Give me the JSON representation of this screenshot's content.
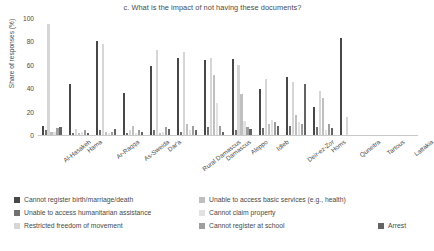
{
  "chart_data": {
    "type": "bar",
    "title": "c. What is the impact of not having these documents?",
    "xlabel": "",
    "ylabel": "Share of responses (%)",
    "ylim": [
      0,
      100
    ],
    "yticks": [
      0,
      20,
      40,
      60,
      80,
      100
    ],
    "grid": false,
    "legend_position": "bottom",
    "categories": [
      "Al-Hasakeh",
      "Hama",
      "Ar-Raqqa",
      "As-Sweida",
      "Dar'a",
      "Rural Damascus",
      "Damascus",
      "Aleppo",
      "Idleb",
      "Deir-ez-Zor",
      "Homs",
      "Quneitra",
      "Tartous",
      "Lattakia"
    ],
    "series": [
      {
        "name": "Cannot register birth/marriage/death",
        "color": "#474747",
        "values": [
          8,
          44,
          80,
          36,
          59,
          66,
          64,
          65,
          39,
          50,
          24,
          83,
          0,
          0
        ]
      },
      {
        "name": "Unable to access humanitarian assistance",
        "color": "#707070",
        "values": [
          4,
          2,
          4,
          2,
          4,
          3,
          7,
          4,
          6,
          8,
          7,
          0,
          0,
          0
        ]
      },
      {
        "name": "Restricted freedom of movement",
        "color": "#d6d6d6",
        "values": [
          95,
          5,
          78,
          4,
          73,
          71,
          66,
          60,
          48,
          45,
          38,
          15,
          0,
          0
        ]
      },
      {
        "name": "Unable to access basic services (e.g., health)",
        "color": "#bfbfbf",
        "values": [
          3,
          2,
          3,
          8,
          2,
          9,
          51,
          35,
          9,
          17,
          32,
          0,
          0,
          0
        ]
      },
      {
        "name": "Cannot claim property",
        "color": "#e2e2e2",
        "values": [
          3,
          3,
          2,
          2,
          3,
          4,
          27,
          12,
          13,
          11,
          4,
          0,
          0,
          0
        ]
      },
      {
        "name": "Cannot register at school",
        "color": "#9e9e9e",
        "values": [
          6,
          4,
          3,
          4,
          7,
          8,
          8,
          7,
          11,
          9,
          9,
          0,
          0,
          0
        ]
      },
      {
        "name": "Arrest",
        "color": "#636363",
        "values": [
          7,
          2,
          5,
          3,
          5,
          4,
          3,
          5,
          8,
          44,
          6,
          0,
          0,
          0
        ]
      }
    ]
  },
  "legend": {
    "items": [
      {
        "label": "Cannot register birth/marriage/death",
        "color": "#474747",
        "col": 0,
        "row": 0
      },
      {
        "label": "Unable to access humanitarian assistance",
        "color": "#707070",
        "col": 0,
        "row": 1
      },
      {
        "label": "Restricted freedom of movement",
        "color": "#d6d6d6",
        "col": 0,
        "row": 2
      },
      {
        "label": "Unable to access basic services (e.g., health)",
        "color": "#bfbfbf",
        "col": 1,
        "row": 0
      },
      {
        "label": "Cannot claim property",
        "color": "#e2e2e2",
        "col": 1,
        "row": 1
      },
      {
        "label": "Cannot register at school",
        "color": "#9e9e9e",
        "col": 1,
        "row": 2
      },
      {
        "label": "Arrest",
        "color": "#636363",
        "col": 2,
        "row": 2
      }
    ]
  }
}
